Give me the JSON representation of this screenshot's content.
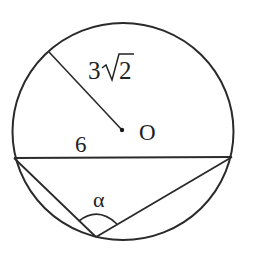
{
  "diagram": {
    "type": "geometry-circle-inscribed-angle",
    "stroke_color": "#2a2a2a",
    "background": "#ffffff",
    "circle": {
      "cx": 123,
      "cy": 131.5,
      "rx": 110.5,
      "ry": 108.5
    },
    "center_point": {
      "x": 122,
      "y": 130,
      "label": "O"
    },
    "radius_segment": {
      "x1": 49,
      "y1": 52,
      "x2": 122,
      "y2": 130
    },
    "chord": {
      "x1": 14,
      "y1": 158,
      "x2": 232,
      "y2": 157
    },
    "inscribed_vertex": {
      "x": 96,
      "y": 237
    },
    "labels": {
      "radius_coefficient": "3",
      "radius_radicand": "2",
      "chord_length": "6",
      "center": "O",
      "angle": "α"
    }
  }
}
